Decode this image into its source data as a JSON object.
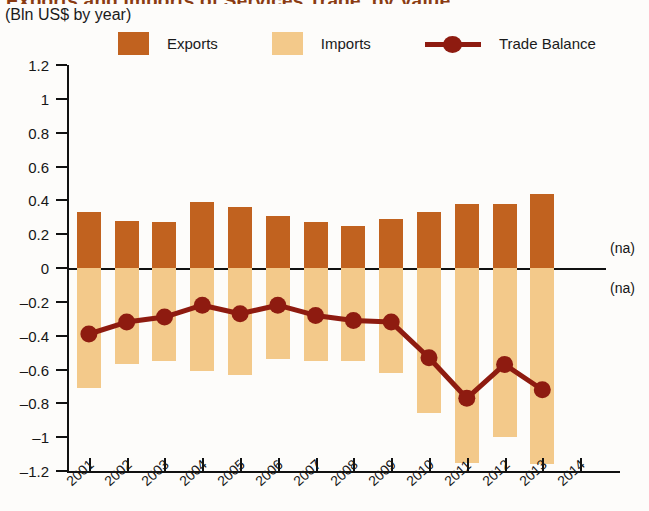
{
  "header": {
    "title_clipped": "Exports and Imports of Services Trade, by Value",
    "subtitle": "(Bln US$ by year)"
  },
  "legend": {
    "position": "top",
    "items": [
      {
        "label": "Exports",
        "type": "swatch",
        "color": "#c1621f",
        "icon": "square-swatch-icon"
      },
      {
        "label": "Imports",
        "type": "swatch",
        "color": "#f3c98a",
        "icon": "square-swatch-icon"
      },
      {
        "label": "Trade Balance",
        "type": "line-marker",
        "color": "#8e1b10",
        "icon": "line-marker-icon"
      }
    ]
  },
  "annotations": [
    {
      "name": "na-above-zero",
      "text": "(na)",
      "value": 0.12
    },
    {
      "name": "na-below-zero",
      "text": "(na)",
      "value": -0.12
    }
  ],
  "chart_data": {
    "type": "bar",
    "title": "Exports and Imports of Services Trade, by Value",
    "subtitle": "(Bln US$ by year)",
    "xlabel": "",
    "ylabel": "",
    "grid": false,
    "legend_position": "top",
    "categories": [
      "2001",
      "2002",
      "2003",
      "2004",
      "2005",
      "2006",
      "2007",
      "2008",
      "2009",
      "2010",
      "2011",
      "2012",
      "2013",
      "2014"
    ],
    "ylim": [
      -1.2,
      1.2
    ],
    "yticks": [
      1.2,
      1,
      0.8,
      0.6,
      0.4,
      0.2,
      0,
      -0.2,
      -0.4,
      -0.6,
      -0.8,
      -1,
      -1.2
    ],
    "ytick_labels": [
      "1.2",
      "1",
      "0.8",
      "0.6",
      "0.4",
      "0.2",
      "0",
      "–0.2",
      "–0.4",
      "–0.6",
      "–0.8",
      "–1",
      "–1.2"
    ],
    "series": [
      {
        "name": "Exports",
        "kind": "bar",
        "color": "#c1621f",
        "values": [
          0.33,
          0.28,
          0.27,
          0.39,
          0.36,
          0.31,
          0.27,
          0.25,
          0.29,
          0.33,
          0.38,
          0.38,
          0.44,
          null
        ]
      },
      {
        "name": "Imports",
        "kind": "bar",
        "color": "#f3c98a",
        "values": [
          -0.71,
          -0.57,
          -0.55,
          -0.61,
          -0.63,
          -0.54,
          -0.55,
          -0.55,
          -0.62,
          -0.86,
          -1.15,
          -1.0,
          -1.16,
          null
        ]
      },
      {
        "name": "Trade Balance",
        "kind": "line",
        "color": "#8e1b10",
        "values": [
          -0.39,
          -0.32,
          -0.29,
          -0.22,
          -0.27,
          -0.22,
          -0.28,
          -0.31,
          -0.32,
          -0.53,
          -0.77,
          -0.57,
          -0.72,
          null
        ]
      }
    ]
  }
}
